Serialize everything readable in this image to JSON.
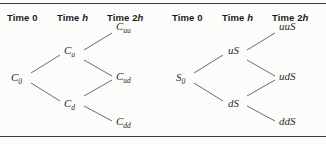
{
  "figure": {
    "background_color": "#fcfcfa",
    "rule_color": "#3b3b3b",
    "branch_color": "#5a5a5a"
  },
  "headers": {
    "time_0": "Time 0",
    "time_h_prefix": "Time ",
    "time_h_var": "h",
    "time_2h_prefix": "Time 2",
    "time_2h_var": "h"
  },
  "trees": [
    {
      "name": "option-value-tree",
      "nodes": {
        "root": {
          "base": "C",
          "sub": "0"
        },
        "up": {
          "base": "C",
          "sub": "u"
        },
        "down": {
          "base": "C",
          "sub": "d"
        },
        "up_up": {
          "base": "C",
          "sub": "uu"
        },
        "up_down": {
          "base": "C",
          "sub": "ud"
        },
        "down_down": {
          "base": "C",
          "sub": "dd"
        }
      }
    },
    {
      "name": "stock-price-tree",
      "nodes": {
        "root": {
          "base": "S",
          "sub": "0"
        },
        "up": {
          "base": "uS",
          "sub": ""
        },
        "down": {
          "base": "dS",
          "sub": ""
        },
        "up_up": {
          "base": "uuS",
          "sub": ""
        },
        "up_down": {
          "base": "udS",
          "sub": ""
        },
        "down_down": {
          "base": "ddS",
          "sub": ""
        }
      }
    }
  ]
}
